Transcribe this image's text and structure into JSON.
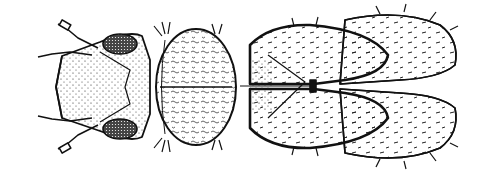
{
  "figure": {
    "background": "#ffffff",
    "ink": "#111111",
    "parts": [
      "antennae",
      "head",
      "compound-eyes",
      "pronotum",
      "mesothorax",
      "forewings",
      "hindwings",
      "setae"
    ]
  }
}
